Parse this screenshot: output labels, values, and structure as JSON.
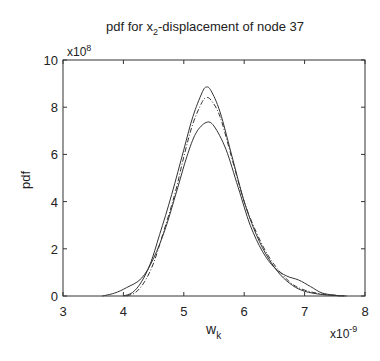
{
  "chart_data": {
    "type": "line",
    "title_parts": {
      "pre": "pdf for x",
      "sub": "2",
      "post": "-displacement of node 37"
    },
    "xlabel": "w",
    "xlabel_sub": "k",
    "ylabel": "pdf",
    "x_multiplier": "x10",
    "x_multiplier_exp": "-9",
    "y_multiplier": "x10",
    "y_multiplier_exp": "8",
    "xlim": [
      3,
      8
    ],
    "ylim": [
      0,
      10
    ],
    "xticks": [
      "3",
      "4",
      "5",
      "6",
      "7",
      "8"
    ],
    "yticks": [
      "0",
      "2",
      "4",
      "6",
      "8",
      "10"
    ],
    "grid": false,
    "legend": null,
    "series": [
      {
        "name": "curve-narrow-tall",
        "style": "solid",
        "points": [
          [
            4.0,
            0
          ],
          [
            4.15,
            0.15
          ],
          [
            4.3,
            0.6
          ],
          [
            4.45,
            1.4
          ],
          [
            4.6,
            2.6
          ],
          [
            4.8,
            4.3
          ],
          [
            5.0,
            6.2
          ],
          [
            5.15,
            7.6
          ],
          [
            5.3,
            8.6
          ],
          [
            5.37,
            8.85
          ],
          [
            5.45,
            8.7
          ],
          [
            5.6,
            7.8
          ],
          [
            5.8,
            5.9
          ],
          [
            6.0,
            4.0
          ],
          [
            6.2,
            2.6
          ],
          [
            6.4,
            1.6
          ],
          [
            6.6,
            0.9
          ],
          [
            6.8,
            0.45
          ],
          [
            7.0,
            0.2
          ],
          [
            7.3,
            0.06
          ],
          [
            7.65,
            0
          ]
        ]
      },
      {
        "name": "curve-narrow-dashed",
        "style": "dashdot",
        "points": [
          [
            4.05,
            0
          ],
          [
            4.2,
            0.15
          ],
          [
            4.35,
            0.6
          ],
          [
            4.5,
            1.4
          ],
          [
            4.65,
            2.6
          ],
          [
            4.85,
            4.3
          ],
          [
            5.0,
            5.9
          ],
          [
            5.15,
            7.3
          ],
          [
            5.3,
            8.2
          ],
          [
            5.37,
            8.4
          ],
          [
            5.45,
            8.3
          ],
          [
            5.6,
            7.6
          ],
          [
            5.8,
            5.8
          ],
          [
            6.0,
            4.0
          ],
          [
            6.2,
            2.7
          ],
          [
            6.4,
            1.7
          ],
          [
            6.6,
            1.0
          ],
          [
            6.8,
            0.5
          ],
          [
            7.0,
            0.25
          ],
          [
            7.3,
            0.08
          ],
          [
            7.7,
            0
          ]
        ]
      },
      {
        "name": "curve-wide",
        "style": "solid",
        "points": [
          [
            3.65,
            0
          ],
          [
            3.85,
            0.12
          ],
          [
            4.05,
            0.35
          ],
          [
            4.3,
            0.75
          ],
          [
            4.5,
            1.6
          ],
          [
            4.7,
            2.9
          ],
          [
            4.9,
            4.6
          ],
          [
            5.05,
            5.9
          ],
          [
            5.2,
            6.9
          ],
          [
            5.37,
            7.35
          ],
          [
            5.5,
            7.2
          ],
          [
            5.7,
            6.2
          ],
          [
            5.9,
            4.6
          ],
          [
            6.1,
            3.0
          ],
          [
            6.3,
            1.9
          ],
          [
            6.5,
            1.2
          ],
          [
            6.7,
            0.85
          ],
          [
            6.9,
            0.68
          ],
          [
            7.1,
            0.4
          ],
          [
            7.3,
            0.12
          ],
          [
            7.6,
            0
          ]
        ]
      }
    ]
  }
}
